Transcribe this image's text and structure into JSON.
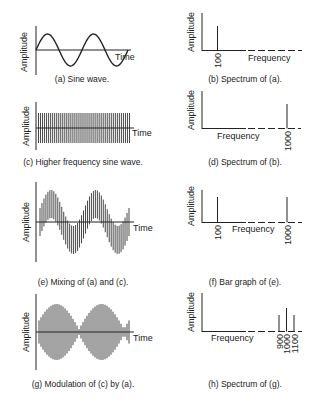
{
  "panels": [
    {
      "id": "a",
      "caption": "(a) Sine wave.",
      "ylabel": "Amplitude",
      "xlabel": "Time",
      "kind": "time"
    },
    {
      "id": "b",
      "caption": "(b) Spectrum of (a).",
      "ylabel": "Amplitude",
      "xlabel": "Frequency",
      "kind": "spectrum",
      "ticks": [
        "100"
      ]
    },
    {
      "id": "c",
      "caption": "(c) Higher frequency sine wave.",
      "ylabel": "Amplitude",
      "xlabel": "Time",
      "kind": "time"
    },
    {
      "id": "d",
      "caption": "(d) Spectrum of (b).",
      "ylabel": "Amplitude",
      "xlabel": "Frequency",
      "kind": "spectrum",
      "ticks": [
        "1000"
      ]
    },
    {
      "id": "e",
      "caption": "(e) Mixing of (a) and (c).",
      "ylabel": "Amplitude",
      "xlabel": "Time",
      "kind": "time"
    },
    {
      "id": "f",
      "caption": "(f) Bar graph of (e).",
      "ylabel": "Amplitude",
      "xlabel": "Frequency",
      "kind": "spectrum",
      "ticks": [
        "100",
        "1000"
      ]
    },
    {
      "id": "g",
      "caption": "(g) Modulation of (c) by (a).",
      "ylabel": "Amplitude",
      "xlabel": "Time",
      "kind": "time"
    },
    {
      "id": "h",
      "caption": "(h) Spectrum of (g).",
      "ylabel": "Amplitude",
      "xlabel": "Frequency",
      "kind": "spectrum",
      "ticks": [
        "900",
        "1000",
        "1100"
      ]
    }
  ],
  "chart_data": [
    {
      "type": "line",
      "panel": "a",
      "title": "(a) Sine wave.",
      "xlabel": "Time",
      "ylabel": "Amplitude",
      "description": "Sine wave, ~2 cycles"
    },
    {
      "type": "bar",
      "panel": "b",
      "title": "(b) Spectrum of (a).",
      "xlabel": "Frequency",
      "ylabel": "Amplitude",
      "categories": [
        "100"
      ],
      "values": [
        1.0
      ]
    },
    {
      "type": "line",
      "panel": "c",
      "title": "(c) Higher frequency sine wave.",
      "xlabel": "Time",
      "ylabel": "Amplitude",
      "description": "High frequency sine, constant amplitude"
    },
    {
      "type": "bar",
      "panel": "d",
      "title": "(d) Spectrum of (b).",
      "xlabel": "Frequency",
      "ylabel": "Amplitude",
      "categories": [
        "1000"
      ],
      "values": [
        1.0
      ]
    },
    {
      "type": "line",
      "panel": "e",
      "title": "(e) Mixing of (a) and (c).",
      "xlabel": "Time",
      "ylabel": "Amplitude",
      "description": "High frequency signal riding on low frequency sine"
    },
    {
      "type": "bar",
      "panel": "f",
      "title": "(f) Bar graph of (e).",
      "xlabel": "Frequency",
      "ylabel": "Amplitude",
      "categories": [
        "100",
        "1000"
      ],
      "values": [
        1.0,
        1.0
      ]
    },
    {
      "type": "line",
      "panel": "g",
      "title": "(g) Modulation of (c) by (a).",
      "xlabel": "Time",
      "ylabel": "Amplitude",
      "description": "Amplitude-modulated carrier with sine envelope"
    },
    {
      "type": "bar",
      "panel": "h",
      "title": "(h) Spectrum of (g).",
      "xlabel": "Frequency",
      "ylabel": "Amplitude",
      "categories": [
        "900",
        "1000",
        "1100"
      ],
      "values": [
        0.6,
        1.0,
        0.6
      ]
    }
  ]
}
